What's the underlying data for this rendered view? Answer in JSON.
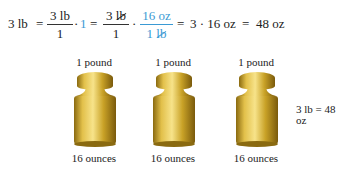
{
  "equation": {
    "lhs": "3 lb",
    "eq1": "=",
    "frac1": {
      "num": "3 lb",
      "den": "1"
    },
    "dot1": "·",
    "one": "1",
    "eq2": "=",
    "frac2": {
      "num_value": "3",
      "num_unit": "lb",
      "den": "1"
    },
    "dot2": "·",
    "frac3": {
      "num": "16 oz",
      "den_value": "1",
      "den_unit": "lb"
    },
    "eq3": "=",
    "step": "3 · 16 oz",
    "eq4": "=",
    "result": "48 oz"
  },
  "weights": [
    {
      "top_label": "1 pound",
      "bottom_label": "16 ounces"
    },
    {
      "top_label": "1 pound",
      "bottom_label": "16 ounces"
    },
    {
      "top_label": "1 pound",
      "bottom_label": "16 ounces"
    }
  ],
  "summary": "3 lb = 48 oz",
  "colors": {
    "accent": "#3a9ad4",
    "gold": "#c9a227",
    "text": "#222222"
  }
}
